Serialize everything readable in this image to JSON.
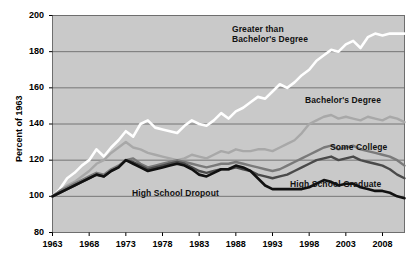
{
  "chart_data": {
    "type": "line",
    "title": "",
    "xlabel": "",
    "ylabel": "Percent of 1963",
    "xlim": [
      1963,
      2011
    ],
    "ylim": [
      80,
      200
    ],
    "grid": true,
    "legend_position": "inline-annotations",
    "x": [
      1963,
      1964,
      1965,
      1966,
      1967,
      1968,
      1969,
      1970,
      1971,
      1972,
      1973,
      1974,
      1975,
      1976,
      1977,
      1978,
      1979,
      1980,
      1981,
      1982,
      1983,
      1984,
      1985,
      1986,
      1987,
      1988,
      1989,
      1990,
      1991,
      1992,
      1993,
      1994,
      1995,
      1996,
      1997,
      1998,
      1999,
      2000,
      2001,
      2002,
      2003,
      2004,
      2005,
      2006,
      2007,
      2008,
      2009,
      2010,
      2011
    ],
    "xticks": [
      1963,
      1968,
      1973,
      1978,
      1983,
      1988,
      1993,
      1998,
      2003,
      2008
    ],
    "xtick_labels": [
      "1963",
      "1968",
      "1973",
      "1978",
      "1983",
      "1988",
      "1993",
      "1998",
      "2003",
      "2008"
    ],
    "yticks": [
      80,
      100,
      120,
      140,
      160,
      180,
      200
    ],
    "ytick_labels": [
      "80",
      "100",
      "120",
      "140",
      "160",
      "180",
      "200"
    ],
    "series": [
      {
        "name": "Greater than Bachelor's Degree",
        "color": "#ffffff",
        "width": 2.6,
        "label_text_line1": "Greater than",
        "label_text_line2": "Bachelor's Degree",
        "values": [
          100,
          104,
          110,
          113,
          117,
          120,
          126,
          122,
          127,
          131,
          136,
          133,
          140,
          142,
          138,
          137,
          136,
          135,
          139,
          142,
          140,
          139,
          142,
          146,
          143,
          147,
          149,
          152,
          155,
          154,
          158,
          162,
          160,
          163,
          167,
          170,
          175,
          178,
          181,
          180,
          184,
          186,
          182,
          188,
          190,
          189,
          190,
          190,
          190
        ]
      },
      {
        "name": "Bachelor's Degree",
        "color": "#a8a8a8",
        "width": 2.4,
        "label_text_line1": "Bachelor's Degree",
        "label_text_line2": "",
        "values": [
          100,
          103,
          106,
          108,
          111,
          114,
          118,
          120,
          124,
          127,
          130,
          127,
          126,
          124,
          123,
          122,
          121,
          120,
          121,
          123,
          122,
          121,
          123,
          125,
          124,
          126,
          125,
          125,
          126,
          126,
          125,
          127,
          129,
          131,
          135,
          140,
          142,
          144,
          145,
          143,
          144,
          143,
          142,
          144,
          143,
          142,
          144,
          143,
          141
        ]
      },
      {
        "name": "Some College",
        "color": "#7a7a7a",
        "width": 2.4,
        "label_text_line1": "Some College",
        "label_text_line2": "",
        "values": [
          100,
          103,
          105,
          107,
          109,
          111,
          113,
          112,
          115,
          117,
          120,
          121,
          118,
          116,
          117,
          118,
          119,
          120,
          119,
          118,
          117,
          116,
          117,
          118,
          118,
          119,
          118,
          117,
          116,
          115,
          114,
          115,
          117,
          119,
          121,
          123,
          125,
          127,
          128,
          126,
          127,
          128,
          126,
          125,
          124,
          123,
          122,
          120,
          117
        ]
      },
      {
        "name": "High School Graduate",
        "color": "#4a4a4a",
        "width": 2.4,
        "label_text_line1": "High School Graduate",
        "label_text_line2": "",
        "values": [
          100,
          102,
          104,
          106,
          108,
          110,
          112,
          111,
          114,
          116,
          120,
          119,
          117,
          115,
          116,
          117,
          118,
          119,
          118,
          116,
          114,
          113,
          114,
          115,
          115,
          116,
          115,
          114,
          112,
          111,
          110,
          111,
          112,
          114,
          116,
          118,
          120,
          121,
          122,
          120,
          121,
          122,
          120,
          119,
          118,
          117,
          115,
          112,
          110
        ]
      },
      {
        "name": "High School Dropout",
        "color": "#111111",
        "width": 2.6,
        "label_text_line1": "High School Dropout",
        "label_text_line2": "",
        "values": [
          100,
          102,
          104,
          106,
          108,
          110,
          112,
          111,
          114,
          116,
          120,
          118,
          116,
          114,
          115,
          116,
          117,
          118,
          117,
          115,
          112,
          111,
          113,
          115,
          115,
          117,
          116,
          114,
          110,
          106,
          104,
          104,
          104,
          104,
          104,
          105,
          107,
          109,
          108,
          106,
          107,
          107,
          105,
          104,
          103,
          103,
          102,
          100,
          99
        ]
      }
    ]
  },
  "axis": {
    "y_title": "Percent of 1963"
  }
}
